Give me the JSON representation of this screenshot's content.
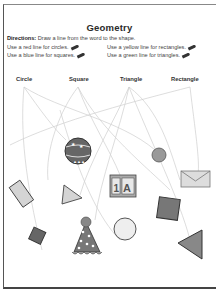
{
  "worksheet": {
    "title": "Geometry",
    "directions_label": "Directions:",
    "directions_text": "Draw a line from the word to the shape.",
    "instructions": [
      {
        "text": "Use a red line for circles.",
        "icon": "pencil-icon"
      },
      {
        "text": "Use a yellow line for rectangles.",
        "icon": "pencil-icon"
      },
      {
        "text": "Use a blue line for squares.",
        "icon": "pencil-icon"
      },
      {
        "text": "Use a green line for triangles.",
        "icon": "pencil-icon"
      }
    ],
    "words": [
      "Circle",
      "Square",
      "Triangle",
      "Rectangle"
    ],
    "shapes": [
      {
        "name": "ball",
        "kind": "circle"
      },
      {
        "name": "red-dot",
        "kind": "circle"
      },
      {
        "name": "tilted-rectangle",
        "kind": "rectangle"
      },
      {
        "name": "triangle-small",
        "kind": "triangle"
      },
      {
        "name": "letter-block",
        "kind": "square"
      },
      {
        "name": "envelope",
        "kind": "rectangle"
      },
      {
        "name": "dark-square-small",
        "kind": "square"
      },
      {
        "name": "party-hat",
        "kind": "triangle"
      },
      {
        "name": "open-circle",
        "kind": "circle"
      },
      {
        "name": "dark-square-large",
        "kind": "square"
      },
      {
        "name": "large-triangle",
        "kind": "triangle"
      }
    ],
    "block_letters": [
      "1",
      "A"
    ]
  },
  "colors": {
    "ink": "#333333",
    "line": "#c8c8c8",
    "fill_gray": "#cfcfcf",
    "fill_dark": "#666666",
    "accent_red": "#a85a5a"
  }
}
